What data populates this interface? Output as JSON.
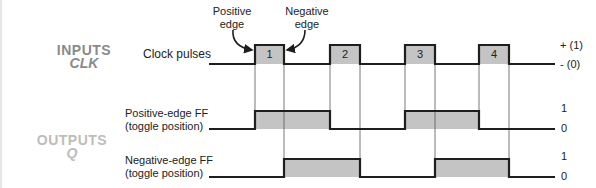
{
  "inputs": {
    "title": "INPUTS",
    "subtitle": "CLK",
    "clock_label": "Clock pulses",
    "level_high": "+ (1)",
    "level_low": "- (0)",
    "pulses": [
      {
        "number": "1",
        "rise_x": 255,
        "fall_x": 284
      },
      {
        "number": "2",
        "rise_x": 330,
        "fall_x": 360
      },
      {
        "number": "3",
        "rise_x": 405,
        "fall_x": 435
      },
      {
        "number": "4",
        "rise_x": 479,
        "fall_x": 509
      }
    ]
  },
  "annotations": {
    "positive_edge": [
      "Positive",
      "edge"
    ],
    "negative_edge": [
      "Negative",
      "edge"
    ]
  },
  "outputs": {
    "title": "OUTPUTS",
    "subtitle": "Q",
    "positive_ff": {
      "label_line1": "Positive-edge FF",
      "label_line2": "(toggle position)",
      "level_high": "1",
      "level_low": "0"
    },
    "negative_ff": {
      "label_line1": "Negative-edge FF",
      "label_line2": "(toggle position)",
      "level_high": "1",
      "level_low": "0"
    }
  },
  "colors": {
    "line": "#1e1e1e",
    "fill": "#c4c4c4",
    "guide": "#555555",
    "inputs_title": "#8a8a8a",
    "outputs_title": "#bdbdbd"
  }
}
